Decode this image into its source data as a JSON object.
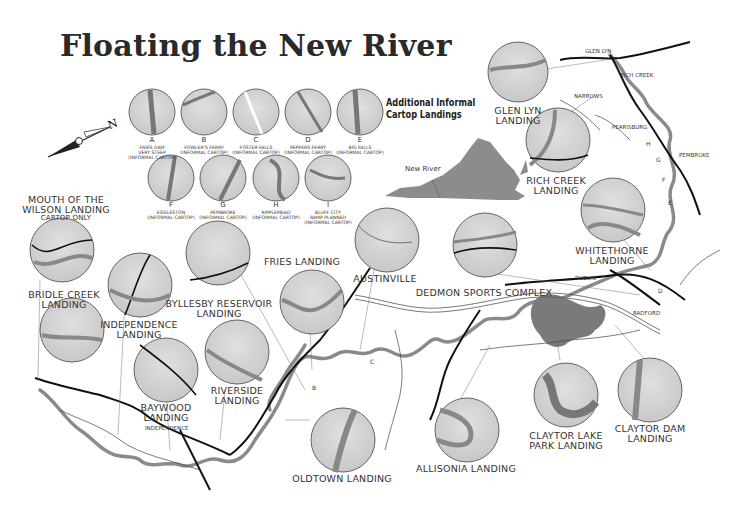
{
  "title": "Floating the New River",
  "compass": {
    "label": "N"
  },
  "inset": {
    "heading_line1": "Additional Informal",
    "heading_line2": "Cartop Landings",
    "state_label": "New River"
  },
  "informal_landings": [
    {
      "letter": "A",
      "name": "FRIES DAM",
      "note1": "VERY STEEP",
      "note2": "(INFORMAL CARTOP)"
    },
    {
      "letter": "B",
      "name": "FOWLER'S FERRY",
      "note1": "(INFORMAL CARTOP)",
      "note2": ""
    },
    {
      "letter": "C",
      "name": "FOSTER FALLS",
      "note1": "(INFORMAL CARTOP)",
      "note2": ""
    },
    {
      "letter": "D",
      "name": "PEPPERS FERRY",
      "note1": "(INFORMAL CARTOP)",
      "note2": ""
    },
    {
      "letter": "E",
      "name": "BIG FALLS",
      "note1": "(INFORMAL CARTOP)",
      "note2": ""
    },
    {
      "letter": "F",
      "name": "EGGLESTON",
      "note1": "(INFORMAL CARTOP)",
      "note2": ""
    },
    {
      "letter": "G",
      "name": "PEMBROKE",
      "note1": "(INFORMAL CARTOP)",
      "note2": ""
    },
    {
      "letter": "H",
      "name": "RIPPLEMEAD",
      "note1": "(INFORMAL CARTOP)",
      "note2": ""
    },
    {
      "letter": "I",
      "name": "BLUFF CITY",
      "note1": "RAMP PLANNED",
      "note2": "(INFORMAL CARTOP)"
    }
  ],
  "landings": [
    {
      "id": "mouth-of-wilson",
      "line1": "MOUTH OF THE",
      "line2": "WILSON LANDING",
      "note": "CARTOP ONLY"
    },
    {
      "id": "bridle-creek",
      "line1": "BRIDLE CREEK",
      "line2": "LANDING"
    },
    {
      "id": "independence",
      "line1": "INDEPENDENCE",
      "line2": "LANDING"
    },
    {
      "id": "byllesby",
      "line1": "BYLLESBY RESERVOIR",
      "line2": "LANDING"
    },
    {
      "id": "fries",
      "line1": "FRIES LANDING",
      "line2": ""
    },
    {
      "id": "austinville",
      "line1": "AUSTINVILLE",
      "line2": ""
    },
    {
      "id": "dedmon",
      "line1": "DEDMON SPORTS COMPLEX",
      "line2": ""
    },
    {
      "id": "whitethorne",
      "line1": "WHITETHORNE",
      "line2": "LANDING"
    },
    {
      "id": "glen-lyn",
      "line1": "GLEN LYN",
      "line2": "LANDING"
    },
    {
      "id": "rich-creek",
      "line1": "RICH CREEK",
      "line2": "LANDING"
    },
    {
      "id": "baywood",
      "line1": "BAYWOOD",
      "line2": "LANDING"
    },
    {
      "id": "riverside",
      "line1": "RIVERSIDE",
      "line2": "LANDING"
    },
    {
      "id": "oldtown",
      "line1": "OLDTOWN LANDING",
      "line2": ""
    },
    {
      "id": "allisonia",
      "line1": "ALLISONIA LANDING",
      "line2": ""
    },
    {
      "id": "claytor-lake-park",
      "line1": "CLAYTOR LAKE",
      "line2": "PARK LANDING"
    },
    {
      "id": "claytor-dam",
      "line1": "CLAYTOR DAM",
      "line2": "LANDING"
    }
  ],
  "towns": {
    "glen_lyn": "GLEN LYN",
    "rich_creek": "RICH CREEK",
    "narrows": "NARROWS",
    "pearisburg": "PEARISBURG",
    "pembroke": "PEMBROKE",
    "dublin": "DUBLIN",
    "radford": "RADFORD",
    "independence": "INDEPENDENCE",
    "austinville": "Austinville",
    "fries": "FRIES",
    "new_river": "NEW RIVER"
  },
  "routes": [
    "460",
    "219",
    "61",
    "100",
    "11",
    "114",
    "81",
    "77",
    "52",
    "94",
    "58",
    "21",
    "221",
    "274",
    "611",
    "625",
    "605",
    "693",
    "629",
    "626",
    "672"
  ],
  "map_letters": [
    "A",
    "B",
    "C",
    "D",
    "E",
    "F",
    "G",
    "H",
    "I"
  ],
  "colors": {
    "river": "#8a8a8a",
    "road": "#111111",
    "circle_fill": "#d6d6d6",
    "state_fill": "#8c8c8c"
  }
}
